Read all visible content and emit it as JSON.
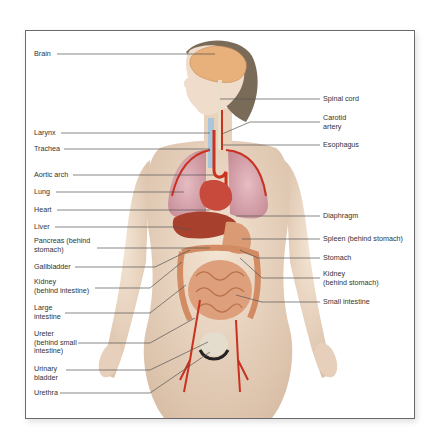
{
  "diagram": {
    "type": "anatomical-organ-system",
    "labels_left": [
      {
        "id": "brain",
        "text": "Brain",
        "x": 34,
        "y": 50
      },
      {
        "id": "larynx",
        "text": "Larynx",
        "x": 34,
        "y": 129
      },
      {
        "id": "trachea",
        "text": "Trachea",
        "x": 34,
        "y": 145
      },
      {
        "id": "aortic-arch",
        "text": "Aortic arch",
        "x": 34,
        "y": 171
      },
      {
        "id": "lung",
        "text": "Lung",
        "x": 34,
        "y": 188
      },
      {
        "id": "heart",
        "text": "Heart",
        "x": 34,
        "y": 206
      },
      {
        "id": "liver",
        "text": "Liver",
        "x": 34,
        "y": 223
      },
      {
        "id": "pancreas",
        "text": "Pancreas (behind\nstomach)",
        "x": 34,
        "y": 237
      },
      {
        "id": "gallbladder",
        "text": "Gallbladder",
        "x": 34,
        "y": 263
      },
      {
        "id": "kidney-left",
        "text": "Kidney\n(behind intestine)",
        "x": 34,
        "y": 278
      },
      {
        "id": "large-intestine",
        "text": "Large\nintestine",
        "x": 34,
        "y": 304
      },
      {
        "id": "ureter",
        "text": "Ureter\n(behind small\nintestine)",
        "x": 34,
        "y": 330
      },
      {
        "id": "urinary-bladder",
        "text": "Urinary\nbladder",
        "x": 34,
        "y": 365
      },
      {
        "id": "urethra",
        "text": "Urethra",
        "x": 34,
        "y": 389
      }
    ],
    "labels_right": [
      {
        "id": "spinal-cord",
        "text": "Spinal cord",
        "x": 323,
        "y": 95
      },
      {
        "id": "carotid-artery",
        "text": "Carotid\nartery",
        "x": 323,
        "y": 114
      },
      {
        "id": "esophagus",
        "text": "Esophagus",
        "x": 323,
        "y": 141
      },
      {
        "id": "diaphragm",
        "text": "Diaphragm",
        "x": 323,
        "y": 212
      },
      {
        "id": "spleen",
        "text": "Spleen (behind stomach)",
        "x": 323,
        "y": 235
      },
      {
        "id": "stomach",
        "text": "Stomach",
        "x": 323,
        "y": 254
      },
      {
        "id": "kidney-right",
        "text": "Kidney\n(behind stomach)",
        "x": 323,
        "y": 270
      },
      {
        "id": "small-intestine",
        "text": "Small intestine",
        "x": 323,
        "y": 298
      }
    ],
    "colors": {
      "skin": "#ecd9c6",
      "skin_shadow": "#d8bda5",
      "brain": "#e8b07a",
      "hair": "#7a6a58",
      "artery": "#c8321f",
      "lung": "#d9a9b0",
      "liver": "#a8402e",
      "intestine": "#d89870",
      "bladder": "#e4dccd",
      "vein": "#7fa3c8",
      "leader_line": "#555555",
      "frame_border": "#6a6a6a"
    }
  }
}
